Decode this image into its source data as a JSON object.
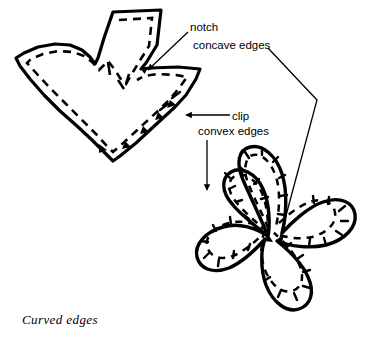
{
  "figure": {
    "caption": "Curved edges",
    "background_color": "#ffffff",
    "ink_color": "#000000",
    "labels": {
      "notch": "notch",
      "concave_edges": "concave edges",
      "clip": "clip",
      "convex_edges": "convex edges"
    },
    "shapes": {
      "leaf": {
        "name": "notched-leaf-pattern-piece",
        "description": "heart-shaped fabric piece with upward tapered projection, dashed seam line, notch at inner V and triangular clips along lower edge"
      },
      "flower": {
        "name": "five-petal-flower-pattern-piece",
        "description": "five rounded petals with dashed seam line and clip marks along convex petal edges",
        "petal_count": 5
      }
    },
    "leaders": {
      "notch": "arrow from label down-left to inner V of leaf",
      "concave_edges": "bent polyline from label right then down to flower inner notch",
      "clip": "horizontal arrow pointing left at leaf right edge",
      "convex_edges": "vertical arrow pointing down to upper-left flower petal"
    }
  }
}
